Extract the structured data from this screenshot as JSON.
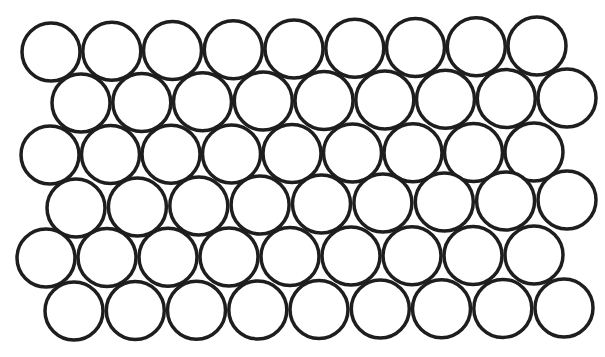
{
  "diagram": {
    "title": "",
    "stroke_color": "#1e1e1e",
    "fill_color": "#ffffff",
    "background": "#ffffff",
    "radius": 29,
    "stroke_width": 3.5,
    "circles_per_row": 9,
    "rows": [
      {
        "start": [
          51,
          52
        ],
        "end": [
          537,
          46
        ]
      },
      {
        "start": [
          81,
          103
        ],
        "end": [
          567,
          98
        ]
      },
      {
        "start": [
          50,
          155
        ],
        "end": [
          534,
          152
        ]
      },
      {
        "start": [
          76,
          208
        ],
        "end": [
          567,
          200
        ]
      },
      {
        "start": [
          46,
          258
        ],
        "end": [
          534,
          255
        ]
      },
      {
        "start": [
          74,
          311
        ],
        "end": [
          564,
          308
        ]
      }
    ]
  }
}
